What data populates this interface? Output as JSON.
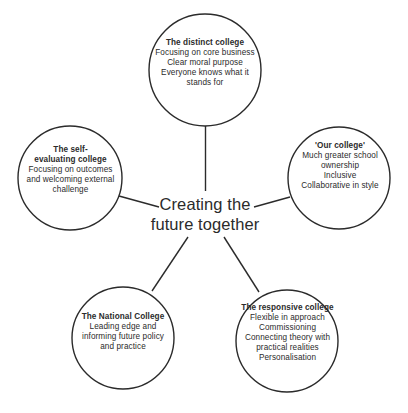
{
  "diagram": {
    "type": "hub-and-spoke",
    "background_color": "#ffffff",
    "stroke_color": "#2b2b2b",
    "text_color": "#2b2b2b",
    "hub": {
      "line1": "Creating the",
      "line2": "future together"
    },
    "nodes": [
      {
        "id": "distinct-college",
        "position": "top",
        "title": "The distinct college",
        "body": "Focusing on core business\nClear moral purpose\nEveryone knows what it\nstands for"
      },
      {
        "id": "our-college",
        "position": "right",
        "title": "'Our college'",
        "body": "Much greater school\nownership\nInclusive\nCollaborative in style"
      },
      {
        "id": "responsive-college",
        "position": "bottom-right",
        "title": "The responsive college",
        "body": "Flexible in approach\nCommissioning\nConnecting theory with\npractical realities\nPersonalisation"
      },
      {
        "id": "national-college",
        "position": "bottom-left",
        "title": "The National College",
        "body": "Leading edge and\ninforming future policy\nand practice"
      },
      {
        "id": "self-evaluating-college",
        "position": "left",
        "title": "The self-\nevaluating college",
        "body": "Focusing on outcomes\nand welcoming external\nchallenge"
      }
    ]
  }
}
